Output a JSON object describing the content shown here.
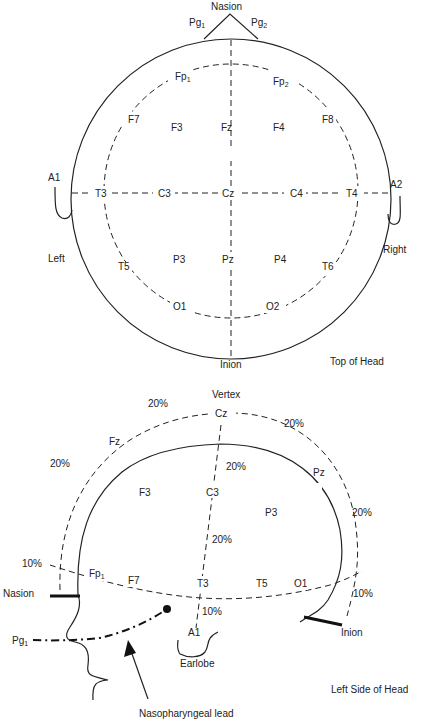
{
  "top_view": {
    "title": "Top of Head",
    "landmarks": {
      "nasion": "Nasion",
      "inion": "Inion",
      "pg1": "Pg",
      "pg1_sub": "1",
      "pg2": "Pg",
      "pg2_sub": "2",
      "a1": "A1",
      "a2": "A2",
      "left": "Left",
      "right": "Right"
    },
    "electrodes": {
      "fp1": "Fp",
      "fp1_sub": "1",
      "fp2": "Fp",
      "fp2_sub": "2",
      "f7": "F7",
      "f3": "F3",
      "fz": "Fz",
      "f4": "F4",
      "f8": "F8",
      "t3": "T3",
      "c3": "C3",
      "cz": "Cz",
      "c4": "C4",
      "t4": "T4",
      "t5": "T5",
      "p3": "P3",
      "pz": "Pz",
      "p4": "P4",
      "t6": "T6",
      "o1": "O1",
      "o2": "O2"
    }
  },
  "side_view": {
    "title": "Left Side of Head",
    "landmarks": {
      "vertex": "Vertex",
      "nasion": "Nasion",
      "inion": "Inion",
      "pg1": "Pg",
      "pg1_sub": "1",
      "a1": "A1",
      "earlobe": "Earlobe",
      "nasopharyngeal": "Nasopharyngeal lead"
    },
    "electrodes": {
      "cz": "Cz",
      "fz": "Fz",
      "pz": "Pz",
      "f3": "F3",
      "c3": "C3",
      "p3": "P3",
      "fp1": "Fp",
      "fp1_sub": "1",
      "f7": "F7",
      "t3": "T3",
      "t5": "T5",
      "o1": "O1"
    },
    "percentages": {
      "top_left": "20%",
      "top_right": "20%",
      "left_mid": "20%",
      "right_mid": "20%",
      "center_upper": "20%",
      "center_lower": "20%",
      "front_low": "10%",
      "back_low": "10%",
      "ear": "10%"
    }
  }
}
